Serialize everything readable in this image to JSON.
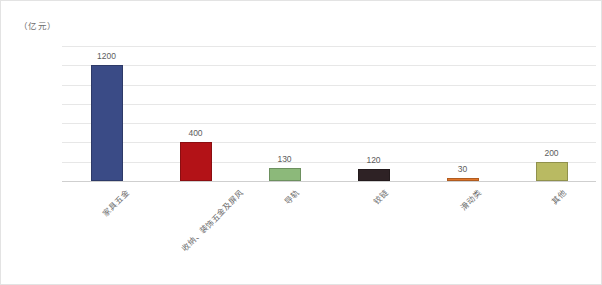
{
  "chart_data": {
    "type": "bar",
    "title": "",
    "subtitle": "",
    "unit_label": "（亿元）",
    "xlabel": "",
    "ylabel": "",
    "ylim": [
      0,
      1400
    ],
    "yticks": [
      0,
      200,
      400,
      600,
      800,
      1000,
      1200,
      1400
    ],
    "grid": true,
    "legend": "none",
    "categories": [
      "家具五金",
      "收纳、装饰五金及屏风",
      "导轨",
      "铰链",
      "滑动类",
      "其他"
    ],
    "values": [
      1200,
      400,
      130,
      120,
      30,
      200
    ],
    "colors": [
      "#3a4b86",
      "#b31217",
      "#8cb97a",
      "#2e2225",
      "#e2762a",
      "#b9ba62"
    ]
  },
  "axis": {
    "tick_labels": [
      "1400",
      "1200",
      "1000",
      "800",
      "600",
      "400",
      "200",
      "0"
    ],
    "unit_caption": "（亿元）"
  },
  "bars": [
    {
      "label": "家具五金",
      "value": 1200,
      "value_text": "1200",
      "color": "#3a4b86"
    },
    {
      "label": "收纳、装饰五金及屏风",
      "value": 400,
      "value_text": "400",
      "color": "#b31217"
    },
    {
      "label": "导轨",
      "value": 130,
      "value_text": "130",
      "color": "#8cb97a"
    },
    {
      "label": "铰链",
      "value": 120,
      "value_text": "120",
      "color": "#2e2225"
    },
    {
      "label": "滑动类",
      "value": 30,
      "value_text": "30",
      "color": "#e2762a"
    },
    {
      "label": "其他",
      "value": 200,
      "value_text": "200",
      "color": "#b9ba62"
    }
  ]
}
